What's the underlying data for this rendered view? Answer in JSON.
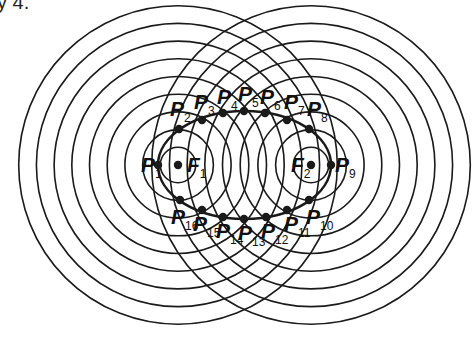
{
  "caption": "y 4.",
  "diagram": {
    "type": "ellipse-from-concentric-circles",
    "focus_1": {
      "x": 178,
      "y": 165
    },
    "focus_2": {
      "x": 311,
      "y": 165
    },
    "circle_spacing": 17.7,
    "circle_count_per_focus": 9,
    "ellipse": {
      "cx": 244.5,
      "cy": 165,
      "rx": 86.5,
      "ry": 54
    },
    "stroke_color": "#1a1a1a",
    "labels": {
      "foci": [
        {
          "id": "F1",
          "letter": "F",
          "sub": "1",
          "x": 187,
          "y": 154
        },
        {
          "id": "F2",
          "letter": "F",
          "sub": "2",
          "x": 291,
          "y": 154
        }
      ],
      "points": [
        {
          "id": "P1",
          "letter": "P",
          "sub": "1",
          "x": 141,
          "y": 154
        },
        {
          "id": "P2",
          "letter": "P",
          "sub": "2",
          "x": 170,
          "y": 98
        },
        {
          "id": "P3",
          "letter": "P",
          "sub": "3",
          "x": 194,
          "y": 91
        },
        {
          "id": "P4",
          "letter": "P",
          "sub": "4",
          "x": 217,
          "y": 86
        },
        {
          "id": "P5",
          "letter": "P",
          "sub": "5",
          "x": 238,
          "y": 83
        },
        {
          "id": "P6",
          "letter": "P",
          "sub": "6",
          "x": 260,
          "y": 86
        },
        {
          "id": "P7",
          "letter": "P",
          "sub": "7",
          "x": 284,
          "y": 91
        },
        {
          "id": "P8",
          "letter": "P",
          "sub": "8",
          "x": 307,
          "y": 98
        },
        {
          "id": "P9",
          "letter": "P",
          "sub": "9",
          "x": 335,
          "y": 154
        },
        {
          "id": "P10",
          "letter": "P",
          "sub": "10",
          "x": 306,
          "y": 206
        },
        {
          "id": "P11",
          "letter": "P",
          "sub": "11",
          "x": 284,
          "y": 213
        },
        {
          "id": "P12",
          "letter": "P",
          "sub": "12",
          "x": 261,
          "y": 220
        },
        {
          "id": "P13",
          "letter": "P",
          "sub": "13",
          "x": 238,
          "y": 222
        },
        {
          "id": "P14",
          "letter": "P",
          "sub": "14",
          "x": 216,
          "y": 220
        },
        {
          "id": "P15",
          "letter": "P",
          "sub": "15",
          "x": 193,
          "y": 213
        },
        {
          "id": "P16",
          "letter": "P",
          "sub": "16",
          "x": 171,
          "y": 206
        }
      ]
    },
    "dots": [
      {
        "id": "P1",
        "x": 158,
        "y": 165
      },
      {
        "id": "F1",
        "x": 178,
        "y": 165
      },
      {
        "id": "P2",
        "x": 179,
        "y": 129
      },
      {
        "id": "P3",
        "x": 202,
        "y": 120
      },
      {
        "id": "P4",
        "x": 223,
        "y": 113
      },
      {
        "id": "P5",
        "x": 244,
        "y": 111
      },
      {
        "id": "P6",
        "x": 265,
        "y": 113
      },
      {
        "id": "P7",
        "x": 287,
        "y": 120
      },
      {
        "id": "P8",
        "x": 309,
        "y": 129
      },
      {
        "id": "F2",
        "x": 311,
        "y": 165
      },
      {
        "id": "P9",
        "x": 331,
        "y": 165
      },
      {
        "id": "P10",
        "x": 309,
        "y": 200
      },
      {
        "id": "P11",
        "x": 287,
        "y": 210
      },
      {
        "id": "P12",
        "x": 266,
        "y": 217
      },
      {
        "id": "P13",
        "x": 244,
        "y": 219
      },
      {
        "id": "P14",
        "x": 223,
        "y": 217
      },
      {
        "id": "P15",
        "x": 202,
        "y": 210
      },
      {
        "id": "P16",
        "x": 180,
        "y": 200
      }
    ]
  }
}
